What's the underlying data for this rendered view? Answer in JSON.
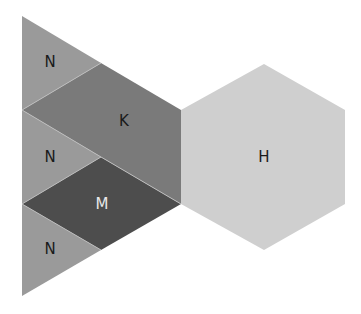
{
  "diagram": {
    "shapes": [
      {
        "id": "n-top",
        "label": "N",
        "type": "triangle",
        "fill": "#9a9a9a",
        "label_color": "#1a1a1a"
      },
      {
        "id": "k",
        "label": "K",
        "type": "pentagon",
        "fill": "#7a7a7a",
        "label_color": "#1a1a1a"
      },
      {
        "id": "n-mid",
        "label": "N",
        "type": "triangle",
        "fill": "#9a9a9a",
        "label_color": "#1a1a1a"
      },
      {
        "id": "m",
        "label": "M",
        "type": "rhombus",
        "fill": "#4d4d4d",
        "label_color": "#e8e8e8"
      },
      {
        "id": "n-bot",
        "label": "N",
        "type": "triangle",
        "fill": "#9a9a9a",
        "label_color": "#1a1a1a"
      },
      {
        "id": "h",
        "label": "H",
        "type": "hexagon",
        "fill": "#cfcfcf",
        "label_color": "#1a1a1a"
      }
    ]
  }
}
